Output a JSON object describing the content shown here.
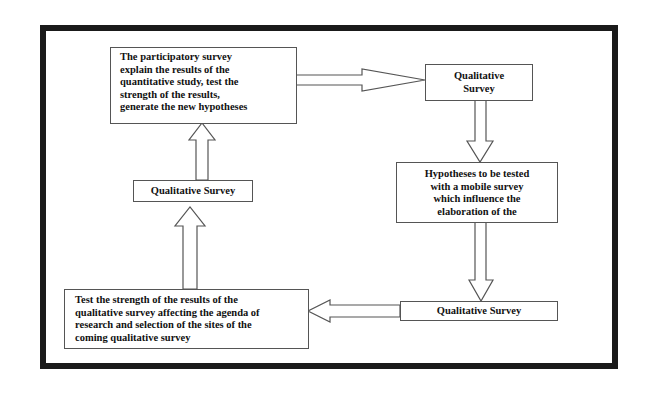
{
  "diagram": {
    "type": "cyclic-flowchart",
    "frame": {
      "border_color": "#1a1a1a"
    },
    "nodes": [
      {
        "id": "participatory-survey",
        "label": "The participatory survey explain the results of the quantitative study, test the strength of the results, generate the new hypotheses",
        "lines": [
          "The participatory survey",
          "explain the results of the",
          "quantitative study, test the",
          "strength of the results,",
          "generate the new hypotheses"
        ]
      },
      {
        "id": "qualitative-survey-top",
        "label": "Qualitative Survey",
        "lines": [
          "Qualitative",
          "Survey"
        ]
      },
      {
        "id": "hypotheses",
        "label": "Hypotheses to be tested with a mobile survey which influence the elaboration of the",
        "lines": [
          "Hypotheses to be tested",
          "with a mobile survey",
          "which influence the",
          "elaboration of the"
        ]
      },
      {
        "id": "qualitative-survey-bottom",
        "label": "Qualitative Survey",
        "lines": [
          "Qualitative Survey"
        ]
      },
      {
        "id": "test-strength",
        "label": "Test the strength of the results of the qualitative survey affecting the agenda of research and selection of the sites of the coming qualitative survey",
        "lines": [
          "Test the strength of the results of the",
          "qualitative survey affecting the agenda of",
          "research and selection of the sites of the",
          "coming qualitative survey"
        ]
      },
      {
        "id": "qualitative-survey-left",
        "label": "Qualitative Survey",
        "lines": [
          "Qualitative Survey"
        ]
      }
    ],
    "edges": [
      {
        "from": "participatory-survey",
        "to": "qualitative-survey-top",
        "direction": "right"
      },
      {
        "from": "qualitative-survey-top",
        "to": "hypotheses",
        "direction": "down"
      },
      {
        "from": "hypotheses",
        "to": "qualitative-survey-bottom",
        "direction": "down"
      },
      {
        "from": "qualitative-survey-bottom",
        "to": "test-strength",
        "direction": "left"
      },
      {
        "from": "test-strength",
        "to": "qualitative-survey-left",
        "direction": "up"
      },
      {
        "from": "qualitative-survey-left",
        "to": "participatory-survey",
        "direction": "up"
      }
    ]
  }
}
